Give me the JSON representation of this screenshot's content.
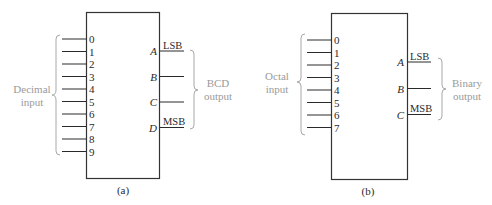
{
  "diagram_a": {
    "caption": "(a)",
    "input_group_label_line1": "Decimal",
    "input_group_label_line2": "input",
    "output_group_label_line1": "BCD",
    "output_group_label_line2": "output",
    "inputs": [
      "0",
      "1",
      "2",
      "3",
      "4",
      "5",
      "6",
      "7",
      "8",
      "9"
    ],
    "outputs": [
      {
        "port": "A",
        "tag": "LSB"
      },
      {
        "port": "B",
        "tag": ""
      },
      {
        "port": "C",
        "tag": ""
      },
      {
        "port": "D",
        "tag": "MSB"
      }
    ]
  },
  "diagram_b": {
    "caption": "(b)",
    "input_group_label_line1": "Octal",
    "input_group_label_line2": "input",
    "output_group_label_line1": "Binary",
    "output_group_label_line2": "output",
    "inputs": [
      "0",
      "1",
      "2",
      "3",
      "4",
      "5",
      "6",
      "7"
    ],
    "outputs": [
      {
        "port": "A",
        "tag": "LSB"
      },
      {
        "port": "B",
        "tag": ""
      },
      {
        "port": "C",
        "tag": "MSB"
      }
    ]
  },
  "colors": {
    "line": "#2a2a2a",
    "group_label": "#9a9a9a"
  }
}
